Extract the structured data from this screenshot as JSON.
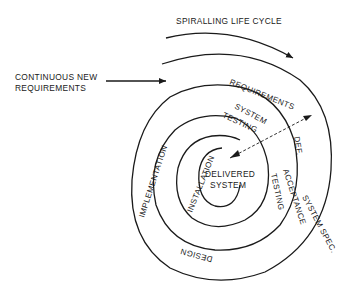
{
  "diagram": {
    "title": "SPIRALLING LIFE CYCLE",
    "input_label_line1": "CONTINUOUS NEW",
    "input_label_line2": "REQUIREMENTS",
    "center_line1": "DELIVERED",
    "center_line2": "SYSTEM",
    "phases": {
      "requirements_def": "REQUIREMENTS",
      "def": "DEF.",
      "system_spec": "SYSTEM SPEC.",
      "design": "DESIGN",
      "implementation": "IMPLEMENTATION",
      "system_testing_1": "SYSTEM",
      "system_testing_2": "TESTING",
      "acceptance_testing_1": "ACCEPTANCE",
      "acceptance_testing_2": "TESTING",
      "installation": "INSTALLATION"
    },
    "colors": {
      "ink": "#1a1a1a",
      "background": "#ffffff"
    }
  }
}
